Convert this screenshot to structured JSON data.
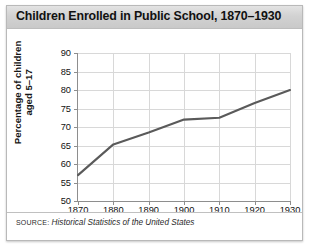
{
  "figure": {
    "title": "Children Enrolled in Public School, 1870–1930",
    "source_word": "SOURCE:",
    "source_title": "Historical Statistics of the United States"
  },
  "axes": {
    "ylabel_line1": "Percentage of children",
    "ylabel_line2": "aged 5–17"
  },
  "chart_data": {
    "type": "line",
    "title": "Children Enrolled in Public School, 1870–1930",
    "xlabel": "",
    "ylabel": "Percentage of children aged 5–17",
    "x": [
      1870,
      1880,
      1890,
      1900,
      1910,
      1920,
      1930
    ],
    "values": [
      57,
      65.3,
      68.5,
      72,
      72.5,
      76.5,
      80
    ],
    "xticklabels": [
      "1870",
      "1880",
      "1890",
      "1900",
      "1910",
      "1920",
      "1930"
    ],
    "yticklabels": [
      "50",
      "55",
      "60",
      "65",
      "70",
      "75",
      "80",
      "85",
      "90"
    ],
    "yticks": [
      50,
      55,
      60,
      65,
      70,
      75,
      80,
      85,
      90
    ],
    "xlim": [
      1870,
      1930
    ],
    "ylim": [
      50,
      90
    ],
    "grid": true,
    "legend": false,
    "line_color": "#5a5a5a",
    "grid_color": "#d8d8d8",
    "axis_color": "#8e8e8e"
  }
}
